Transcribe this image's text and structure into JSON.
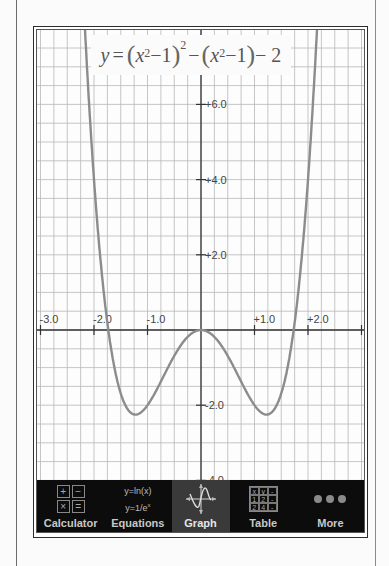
{
  "graph": {
    "equation_label": "y = (x² − 1)² − (x² − 1) − 2",
    "equation_parts": {
      "y": "y",
      "eq": "=",
      "x1": "x",
      "sup1": "2",
      "minus1": "−1",
      "outer_sup": "2",
      "minus_mid": "−",
      "x2": "x",
      "sup2": "2",
      "minus2": "−1",
      "tail": "− 2"
    },
    "x_tick_labels": [
      "-3.0",
      "-2.0",
      "-1.0",
      "+1.0",
      "+2.0"
    ],
    "y_tick_labels": [
      "+6.0",
      "+4.0",
      "+2.0",
      "-2.0",
      "-4.0"
    ],
    "curve_color": "#8c8c8c",
    "axis_color": "#333333",
    "grid_color": "#b8b8b8"
  },
  "chart_data": {
    "type": "line",
    "xlabel": "",
    "ylabel": "",
    "xlim": [
      -3.05,
      3.1
    ],
    "ylim": [
      -4.1,
      7.9
    ],
    "grid": true,
    "x_ticks": [
      -3,
      -2,
      -1,
      1,
      2
    ],
    "y_ticks": [
      6,
      4,
      2,
      -2,
      -4
    ],
    "series": [
      {
        "name": "y = (x^2 - 1)^2 - (x^2 - 1) - 2",
        "x": [
          -2.1,
          -2.0,
          -1.9,
          -1.8,
          -1.732,
          -1.6,
          -1.5,
          -1.4,
          -1.3,
          -1.2247,
          -1.1,
          -1.0,
          -0.9,
          -0.8,
          -0.6,
          -0.4,
          -0.2,
          0.0,
          0.2,
          0.4,
          0.6,
          0.8,
          0.9,
          1.0,
          1.1,
          1.2247,
          1.3,
          1.4,
          1.5,
          1.6,
          1.732,
          1.8,
          1.9,
          2.0,
          2.1
        ],
        "y": [
          7.73,
          4.0,
          1.78,
          0.39,
          0.0,
          -1.22,
          -1.69,
          -2.05,
          -2.23,
          -2.25,
          -2.2,
          -2.0,
          -1.7,
          -1.32,
          -0.66,
          -0.25,
          -0.06,
          0.0,
          -0.06,
          -0.25,
          -0.66,
          -1.32,
          -1.7,
          -2.0,
          -2.2,
          -2.25,
          -2.23,
          -2.05,
          -1.69,
          -1.22,
          0.0,
          0.39,
          1.78,
          4.0,
          7.73
        ]
      }
    ],
    "key_points": {
      "local_max": [
        0,
        0
      ],
      "minima": [
        [
          -1.2247,
          -2.25
        ],
        [
          1.2247,
          -2.25
        ]
      ],
      "roots": [
        -1.732,
        0,
        1.732
      ]
    }
  },
  "toolbar": {
    "tabs": [
      {
        "label": "Calculator",
        "icon": "calculator-icon",
        "active": false
      },
      {
        "label": "Equations",
        "icon": "equations-icon",
        "active": false
      },
      {
        "label": "Graph",
        "icon": "graph-icon",
        "active": true
      },
      {
        "label": "Table",
        "icon": "table-icon",
        "active": false
      },
      {
        "label": "More",
        "icon": "more-dots-icon",
        "active": false
      }
    ],
    "calculator_icon_keys": [
      "+",
      "−",
      "×",
      "="
    ],
    "equations_icon_lines": [
      "y=ln(x)",
      "y=1/e",
      "x"
    ],
    "table_icon_cells": [
      "x",
      "y",
      "-",
      "1",
      "2",
      "-",
      "2",
      "4",
      "-"
    ]
  }
}
